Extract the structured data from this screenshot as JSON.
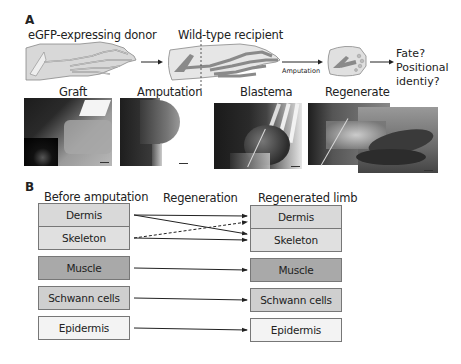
{
  "panel_a": {
    "letter": "A",
    "donor_label": "eGFP-expressing donor",
    "recipient_label": "Wild-type recipient",
    "amputation_arrow_label": "Amputation",
    "outcome_lines": [
      "Fate?",
      "Positional",
      "identiy?"
    ],
    "photos": [
      {
        "label": "Graft"
      },
      {
        "label": "Amputation"
      },
      {
        "label": "Blastema"
      },
      {
        "label": "Regenerate"
      }
    ]
  },
  "panel_b": {
    "letter": "B",
    "headers": {
      "left": "Before amputation",
      "middle": "Regeneration",
      "right": "Regenerated limb"
    },
    "left_boxes": [
      "Dermis",
      "Skeleton",
      "Muscle",
      "Schwann cells",
      "Epidermis"
    ],
    "right_boxes": [
      "Dermis",
      "Skeleton",
      "Muscle",
      "Schwann cells",
      "Epidermis"
    ],
    "box_colors": {
      "dermis": "#d9d9d9",
      "skeleton": "#e0e0e0",
      "muscle": "#a9a9a9",
      "schwann": "#cfcfcf",
      "epidermis": "#f3f3f3"
    },
    "arrows": [
      {
        "from": "Dermis",
        "to": "Dermis",
        "style": "solid"
      },
      {
        "from": "Dermis",
        "to": "Skeleton",
        "style": "solid"
      },
      {
        "from": "Skeleton",
        "to": "Dermis",
        "style": "dashed"
      },
      {
        "from": "Skeleton",
        "to": "Skeleton",
        "style": "solid"
      },
      {
        "from": "Muscle",
        "to": "Muscle",
        "style": "solid"
      },
      {
        "from": "Schwann cells",
        "to": "Schwann cells",
        "style": "solid"
      },
      {
        "from": "Epidermis",
        "to": "Epidermis",
        "style": "solid"
      }
    ]
  }
}
